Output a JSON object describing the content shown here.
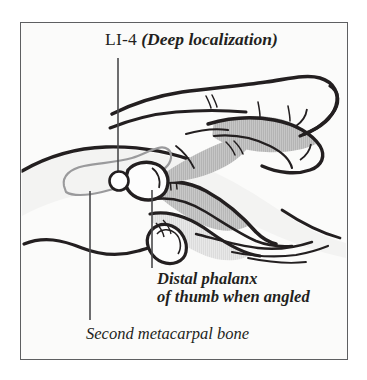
{
  "figure": {
    "kind": "anatomical-illustration",
    "title_point_code": "LI-4",
    "title_qualifier": "(Deep localization)",
    "background_color": "#fbfbfa",
    "frame_color": "#5e5f61",
    "ink_color": "#231f20",
    "shading_color": "#b4b4b4",
    "bone_outline_color": "#9a9a9c",
    "point_marker_color": "#ffffff",
    "labels": [
      {
        "name": "point-code",
        "text": "LI-4",
        "style": "roman"
      },
      {
        "name": "point-qualifier",
        "text": "(Deep localization)",
        "style": "bold-italic"
      },
      {
        "name": "distal-phalanx",
        "line1": "Distal phalanx",
        "line2": "of thumb when angled",
        "style": "bold-italic"
      },
      {
        "name": "second-metacarpal",
        "text": "Second metacarpal bone",
        "style": "italic"
      }
    ],
    "leader_lines": [
      {
        "name": "leader-to-point",
        "from": [
          118,
          58
        ],
        "to": [
          118,
          172
        ]
      },
      {
        "name": "leader-to-metacarpal",
        "from": [
          90,
          191
        ],
        "to": [
          90,
          320
        ]
      },
      {
        "name": "leader-to-distal-phalanx",
        "from": [
          152,
          190
        ],
        "to": [
          152,
          268
        ]
      }
    ],
    "point_marker": {
      "name": "li4-point",
      "cx": 119,
      "cy": 181,
      "r": 9.5
    }
  }
}
